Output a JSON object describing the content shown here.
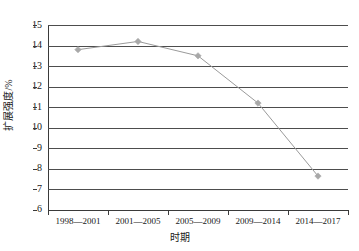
{
  "chart_data": {
    "type": "line",
    "title": "",
    "subtitle": "",
    "xlabel": "时期",
    "ylabel": "扩展强度/%",
    "categories": [
      "1998—2001",
      "2001—2005",
      "2005—2009",
      "2009—2014",
      "2014—2017"
    ],
    "values": [
      13.8,
      14.2,
      13.5,
      11.2,
      7.65
    ],
    "series": [
      {
        "name": "扩展强度",
        "values": [
          13.8,
          14.2,
          13.5,
          11.2,
          7.65
        ]
      }
    ],
    "ylim": [
      6,
      15
    ],
    "yticks": [
      6,
      7,
      8,
      9,
      10,
      11,
      12,
      13,
      14,
      15
    ],
    "ytick_labels": [
      "6",
      "7",
      "8",
      "9",
      "10",
      "11",
      "12",
      "13",
      "14",
      "15"
    ],
    "grid": "horizontal",
    "legend": "none",
    "marker": "diamond",
    "line_color": "#9a9a9a",
    "marker_color": "#a8a8a8",
    "grid_color": "#4d4d4d",
    "axis_color": "#3a3a3a",
    "background": "#ffffff"
  },
  "axes": {
    "y_title": "扩展强度/%",
    "x_title": "时期",
    "y_tick_labels": [
      "15",
      "14",
      "13",
      "12",
      "11",
      "10",
      "9",
      "8",
      "7",
      "6"
    ],
    "x_tick_labels": [
      "1998—2001",
      "2001—2005",
      "2005—2009",
      "2009—2014",
      "2014—2017"
    ]
  }
}
